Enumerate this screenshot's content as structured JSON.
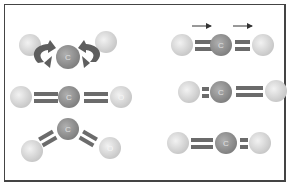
{
  "diagram": {
    "atoms": {
      "carbon_label": "C",
      "oxygen_label": "O"
    },
    "colors": {
      "carbon_fill": "#8f8f8f",
      "oxygen_fill": "#d8d8d8",
      "bond": "#6b6b6b",
      "arrow": "#5a5a5a",
      "frame": "#444444"
    },
    "panels": [
      {
        "id": "bending-rotation",
        "description": "Bent molecule with curved rotation arrows around bonds",
        "position": "top-left"
      },
      {
        "id": "linear-double-bonds",
        "description": "Linear O=C=O with double bonds",
        "position": "middle-left"
      },
      {
        "id": "bent",
        "description": "Bent O=C=O molecule",
        "position": "bottom-left"
      },
      {
        "id": "translation",
        "description": "Linear O=C=O with two right-pointing arrows above",
        "position": "top-right"
      },
      {
        "id": "asymmetric-stretch-1",
        "description": "Short left bond, long right bond",
        "position": "middle-right"
      },
      {
        "id": "asymmetric-stretch-2",
        "description": "Long left bond, short right bond",
        "position": "bottom-right"
      }
    ]
  }
}
